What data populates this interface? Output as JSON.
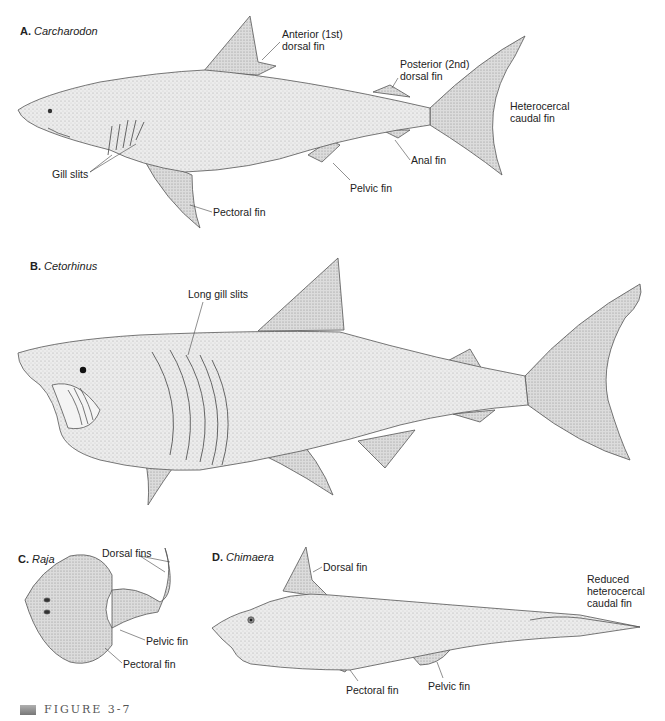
{
  "panels": [
    {
      "letter": "A.",
      "genus": "Carcharodon",
      "labels": {
        "anterior_dorsal": "Anterior (1st)\ndorsal fin",
        "posterior_dorsal": "Posterior (2nd)\ndorsal fin",
        "caudal": "Heterocercal\ncaudal fin",
        "anal": "Anal fin",
        "pelvic": "Pelvic fin",
        "pectoral": "Pectoral fin",
        "gill": "Gill slits"
      }
    },
    {
      "letter": "B.",
      "genus": "Cetorhinus",
      "labels": {
        "gill": "Long gill slits"
      }
    },
    {
      "letter": "C.",
      "genus": "Raja",
      "labels": {
        "dorsal": "Dorsal fins",
        "pelvic": "Pelvic fin",
        "pectoral": "Pectoral fin"
      }
    },
    {
      "letter": "D.",
      "genus": "Chimaera",
      "labels": {
        "dorsal": "Dorsal fin",
        "caudal": "Reduced\nheterocercal\ncaudal fin",
        "pectoral": "Pectoral fin",
        "pelvic": "Pelvic fin"
      }
    }
  ],
  "caption": "FIGURE 3-7",
  "colors": {
    "outline": "#555555",
    "fill": "#e4e4e4",
    "fill_dark": "#cfcfcf"
  }
}
